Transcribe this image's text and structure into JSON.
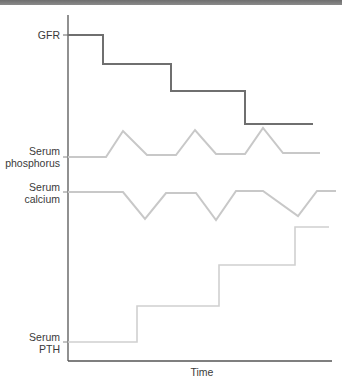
{
  "chart_data": {
    "type": "line",
    "title": "",
    "xlabel": "Time",
    "ylabel": "",
    "grid": false,
    "legend": "none (labels on y-axis)",
    "series": [
      {
        "name": "GFR",
        "color": "#6f6f6f",
        "shape": "step-down",
        "points": [
          [
            68,
            35
          ],
          [
            103,
            35
          ],
          [
            103,
            64
          ],
          [
            171,
            64
          ],
          [
            171,
            91
          ],
          [
            245,
            91
          ],
          [
            245,
            124
          ],
          [
            313,
            124
          ]
        ]
      },
      {
        "name": "Serum phosphorus",
        "color": "#c8c8c8",
        "shape": "baseline with three peaks",
        "points": [
          [
            68,
            157
          ],
          [
            106,
            157
          ],
          [
            123,
            131
          ],
          [
            147,
            155
          ],
          [
            176,
            155
          ],
          [
            195,
            130
          ],
          [
            216,
            154
          ],
          [
            245,
            154
          ],
          [
            263,
            128
          ],
          [
            283,
            153
          ],
          [
            320,
            153
          ]
        ]
      },
      {
        "name": "Serum calcium",
        "color": "#c8c8c8",
        "shape": "baseline with three troughs",
        "points": [
          [
            68,
            192
          ],
          [
            123,
            192
          ],
          [
            145,
            219
          ],
          [
            166,
            193
          ],
          [
            196,
            193
          ],
          [
            216,
            220
          ],
          [
            236,
            191
          ],
          [
            263,
            191
          ],
          [
            298,
            216
          ],
          [
            317,
            191
          ],
          [
            336,
            191
          ]
        ]
      },
      {
        "name": "Serum PTH",
        "color": "#d0d0d0",
        "shape": "step-up",
        "points": [
          [
            68,
            342
          ],
          [
            137,
            342
          ],
          [
            137,
            306
          ],
          [
            219,
            306
          ],
          [
            219,
            265
          ],
          [
            295,
            265
          ],
          [
            295,
            227
          ],
          [
            329,
            227
          ]
        ]
      }
    ],
    "axes": {
      "y_axis": {
        "x": 68,
        "y_top": 15,
        "y_bottom": 361,
        "color": "#555555"
      },
      "x_axis": {
        "y": 361,
        "x_left": 68,
        "x_right": 332,
        "color": "#555555"
      }
    }
  },
  "labels": {
    "gfr": "GFR",
    "phosphorus_line1": "Serum",
    "phosphorus_line2": "phosphorus",
    "calcium_line1": "Serum",
    "calcium_line2": "calcium",
    "pth_line1": "Serum",
    "pth_line2": "PTH",
    "x_axis": "Time"
  }
}
